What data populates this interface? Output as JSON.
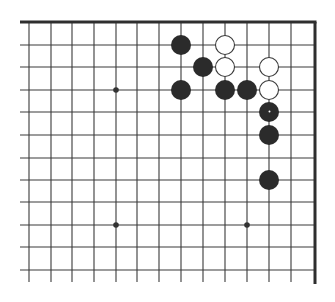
{
  "diagram": {
    "type": "go-board-fragment",
    "colors": {
      "background": "#ffffff",
      "grid_line": "#3a3a3a",
      "border": "#2e2e2e",
      "black_stone": "#2b2b2b",
      "white_stone_fill": "#ffffff",
      "white_stone_stroke": "#3a3a3a",
      "hoshi": "#333333"
    },
    "grid": {
      "columns_x": [
        29,
        51,
        72,
        94,
        116,
        137,
        159,
        181,
        203,
        225,
        247,
        269,
        291
      ],
      "right_edge_x": 315,
      "top_edge_y": 22,
      "rows_y": [
        22,
        45,
        67,
        90,
        112,
        135,
        158,
        180,
        202,
        225,
        247,
        270
      ],
      "line_left_x": 20,
      "line_bottom_y": 282
    },
    "hoshi_points": [
      {
        "col": 4,
        "row": 3
      },
      {
        "col": 4,
        "row": 9
      },
      {
        "col": 10,
        "row": 9
      }
    ],
    "stones": [
      {
        "color": "black",
        "col": 7,
        "row": 1
      },
      {
        "color": "white",
        "col": 9,
        "row": 1
      },
      {
        "color": "black",
        "col": 8,
        "row": 2
      },
      {
        "color": "white",
        "col": 9,
        "row": 2
      },
      {
        "color": "white",
        "col": 11,
        "row": 2
      },
      {
        "color": "black",
        "col": 7,
        "row": 3
      },
      {
        "color": "black",
        "col": 9,
        "row": 3
      },
      {
        "color": "black",
        "col": 10,
        "row": 3
      },
      {
        "color": "white",
        "col": 11,
        "row": 3
      },
      {
        "color": "black",
        "col": 11,
        "row": 4,
        "marked": true
      },
      {
        "color": "black",
        "col": 11,
        "row": 5
      },
      {
        "color": "black",
        "col": 11,
        "row": 7
      }
    ],
    "stone_radius": 10
  }
}
